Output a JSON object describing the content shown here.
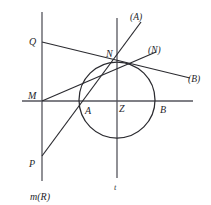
{
  "figure": {
    "background_color": "#ffffff",
    "stroke_color": "#2b2b30",
    "axis_color": "#4a4a52",
    "labels": {
      "Q": "Q",
      "M": "M",
      "P": "P",
      "N": "N",
      "Z": "Z",
      "A": "A",
      "B": "B",
      "t": "t",
      "mR": "m(R)",
      "lineA": "(A)",
      "lineN": "(N)",
      "lineB": "(B)"
    },
    "points": [
      {
        "name": "Q",
        "x": 42,
        "y": 42
      },
      {
        "name": "M",
        "x": 42,
        "y": 101
      },
      {
        "name": "P",
        "x": 42,
        "y": 155
      },
      {
        "name": "N",
        "x": 117,
        "y": 59
      },
      {
        "name": "Z",
        "x": 117,
        "y": 101
      },
      {
        "name": "A",
        "x": 90,
        "y": 101
      },
      {
        "name": "B",
        "x": 155,
        "y": 101
      }
    ],
    "circle": {
      "cx": 117,
      "cy": 100,
      "r": 38
    },
    "axes": {
      "vertical_mR": {
        "x": 42,
        "y1": 12,
        "y2": 181
      },
      "vertical_t": {
        "x": 117,
        "y1": 18,
        "y2": 178
      },
      "horizontal": {
        "y": 101,
        "x1": 22,
        "x2": 193
      }
    },
    "lines": [
      {
        "name": "line-A-tangent",
        "x1": 42,
        "y1": 156,
        "x2": 141,
        "y2": 22
      },
      {
        "name": "line-Q-to-B",
        "x1": 42,
        "y1": 42,
        "x2": 190,
        "y2": 78
      },
      {
        "name": "line-M-to-N",
        "x1": 42,
        "y1": 101,
        "x2": 155,
        "y2": 52
      }
    ]
  }
}
